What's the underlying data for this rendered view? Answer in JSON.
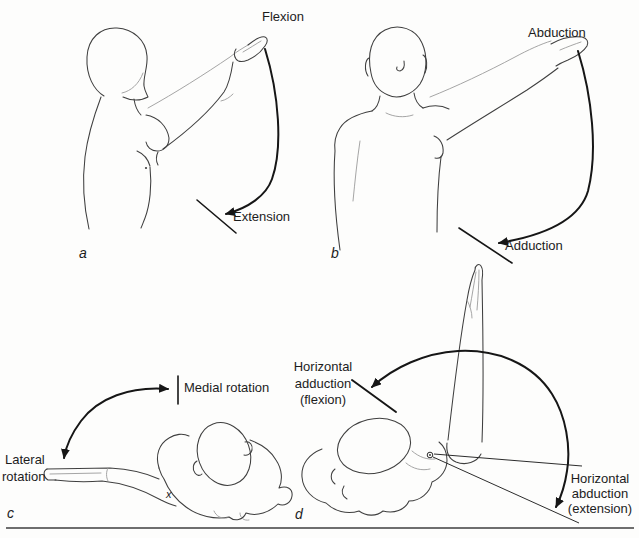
{
  "figure": {
    "type": "anatomical-line-diagram",
    "colors": {
      "background": "#fdfdfc",
      "ink": "#3f3f3f",
      "arrow": "#161616",
      "rule": "#6e6e6e"
    },
    "panels": {
      "a": {
        "caption": "a",
        "labels": {
          "flexion": "Flexion",
          "extension": "Extension"
        }
      },
      "b": {
        "caption": "b",
        "labels": {
          "abduction": "Abduction",
          "adduction": "Adduction"
        }
      },
      "c": {
        "caption": "c",
        "labels": {
          "medial_rotation": "Medial rotation",
          "lateral_rotation": [
            "Lateral",
            "rotation"
          ],
          "marker": "x"
        }
      },
      "d": {
        "caption": "d",
        "labels": {
          "horizontal_adduction": [
            "Horizontal",
            "adduction",
            "(flexion)"
          ],
          "horizontal_abduction": [
            "Horizontal",
            "abduction",
            "(extension)"
          ]
        }
      }
    }
  }
}
